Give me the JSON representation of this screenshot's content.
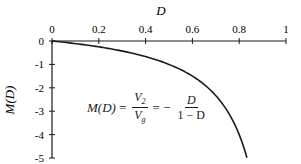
{
  "chart_data": {
    "type": "line",
    "title": "",
    "xlabel": "D",
    "ylabel": "M(D)",
    "xlim": [
      0,
      1
    ],
    "ylim": [
      -5,
      0
    ],
    "x_axis_position": "top",
    "grid": false,
    "legend": null,
    "x_ticks": [
      "0",
      "0.2",
      "0.4",
      "0.6",
      "0.8",
      "1"
    ],
    "y_ticks": [
      "0",
      "-1",
      "-2",
      "-3",
      "-4",
      "-5"
    ],
    "series": [
      {
        "name": "M(D) = -D/(1-D)",
        "x": [
          0,
          0.1,
          0.2,
          0.3,
          0.4,
          0.5,
          0.6,
          0.65,
          0.7,
          0.75,
          0.8,
          0.833
        ],
        "values": [
          0,
          -0.111,
          -0.25,
          -0.429,
          -0.667,
          -1.0,
          -1.5,
          -1.857,
          -2.333,
          -3.0,
          -4.0,
          -5.0
        ]
      }
    ],
    "annotations": [
      {
        "text": "M(D) = V2/Vg = -D/(1-D)",
        "position": "center"
      }
    ]
  },
  "labels": {
    "x_axis_title": "D",
    "y_axis_title": "M(D)",
    "x_ticks": [
      "0",
      "0.2",
      "0.4",
      "0.6",
      "0.8",
      "1"
    ],
    "y_ticks": [
      "0",
      "-1",
      "-2",
      "-3",
      "-4",
      "-5"
    ]
  },
  "formula": {
    "lhs": "M(D)",
    "eq1": "=",
    "num1": "V",
    "num1_sub": "2",
    "den1": "V",
    "den1_sub": "g",
    "eq2": "= −",
    "num2": "D",
    "den2": "1 − D"
  },
  "colors": {
    "line": "#1a1a1a",
    "axis": "#1a1a1a",
    "background": "#ffffff"
  }
}
